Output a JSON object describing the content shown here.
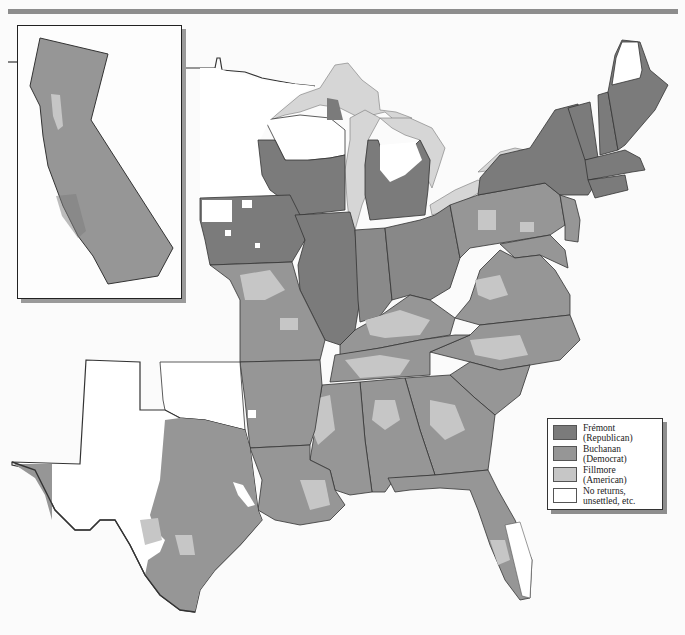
{
  "map": {
    "subject": "1856 U.S. presidential election results by county",
    "colors": {
      "fremont": "#7b7b7b",
      "buchanan": "#969696",
      "fillmore": "#c6c6c6",
      "no_returns": "#ffffff",
      "lakes": "#d6d6d6",
      "border": "#333333",
      "background": "#fbfbfb",
      "top_rule": "#8d8d8d"
    },
    "inset": {
      "region": "California",
      "majority": "buchanan"
    }
  },
  "legend": {
    "items": [
      {
        "key": "fremont",
        "line1": "Frémont",
        "line2": "(Republican)",
        "color": "#7b7b7b"
      },
      {
        "key": "buchanan",
        "line1": "Buchanan",
        "line2": "(Democrat)",
        "color": "#969696"
      },
      {
        "key": "fillmore",
        "line1": "Fillmore",
        "line2": "(American)",
        "color": "#c6c6c6"
      },
      {
        "key": "no_returns",
        "line1": "No returns,",
        "line2": "unsettled, etc.",
        "color": "#ffffff"
      }
    ]
  }
}
